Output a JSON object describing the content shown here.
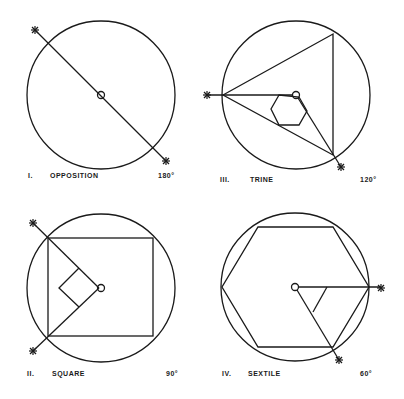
{
  "panels": [
    {
      "numeral": "I.",
      "name": "OPPOSITION",
      "angle": "180°"
    },
    {
      "numeral": "II.",
      "name": "SQUARE",
      "angle": "90°"
    },
    {
      "numeral": "III.",
      "name": "TRINE",
      "angle": "120°"
    },
    {
      "numeral": "IV.",
      "name": "SEXTILE",
      "angle": "60°"
    }
  ],
  "colors": {
    "ink": "#1a1a1a",
    "background": "#ffffff"
  }
}
